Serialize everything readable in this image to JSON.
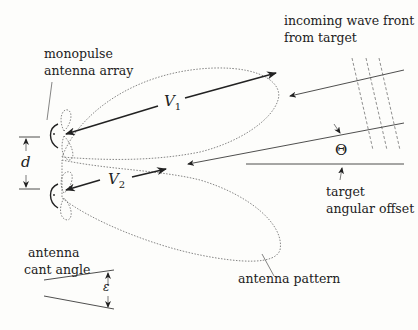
{
  "labels": {
    "incoming_wave_line1": "incoming wave front",
    "incoming_wave_line2": "from target",
    "monopulse_line1": "monopulse",
    "monopulse_line2": "antenna array",
    "target_line1": "target",
    "target_line2": "angular offset",
    "cant_line1": "antenna",
    "cant_line2": "cant angle",
    "antenna_pattern": "antenna pattern"
  },
  "symbols": {
    "v1": "V",
    "v1_sub": "1",
    "v2": "V",
    "v2_sub": "2",
    "d": "d",
    "theta": "Θ",
    "epsilon": "ε"
  },
  "colors": {
    "ink": "#222222",
    "dotted": "#666666",
    "background": "#fdfdfb"
  }
}
